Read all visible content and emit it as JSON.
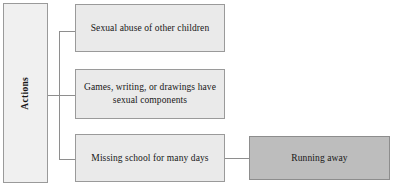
{
  "diagram": {
    "type": "flowchart",
    "title_node": {
      "label": "Actions",
      "orientation": "vertical",
      "fill": "#f0f0f0"
    },
    "action_nodes": [
      {
        "id": "sexual-abuse-of-other-children",
        "label": "Sexual abuse of other children",
        "fill": "#eaeaea"
      },
      {
        "id": "games-writing-drawings-sexual",
        "label": "Games, writing, or drawings have sexual components",
        "fill": "#eaeaea"
      },
      {
        "id": "missing-school-many-days",
        "label": "Missing school for many days",
        "fill": "#eaeaea"
      }
    ],
    "outcome_node": {
      "id": "running-away",
      "label": "Running away",
      "fill": "#bdbdbd"
    },
    "colors": {
      "node_fill_light": "#eaeaea",
      "node_fill_dark": "#bdbdbd",
      "border": "#9a9a9a",
      "connector": "#8e8e8e",
      "text": "#171717",
      "background": "#ffffff"
    }
  }
}
